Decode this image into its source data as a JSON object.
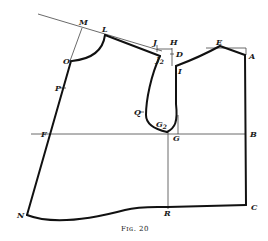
{
  "figure": {
    "caption": "Fig. 20",
    "caption_display": "Fɪɢ. 20"
  },
  "points": {
    "M": "M",
    "L": "L",
    "O": "O",
    "P": "P",
    "F": "F",
    "N": "N",
    "J": "J",
    "J2_main": "J",
    "J2_sub": "2",
    "H": "H",
    "D": "D",
    "I": "I",
    "E": "E",
    "A": "A",
    "Q": "Q",
    "G2_main": "G",
    "G2_sub": "2",
    "G": "G",
    "B": "B",
    "R": "R",
    "C": "C"
  },
  "colors": {
    "line": "#111111",
    "construction_line": "#444444",
    "background": "#ffffff"
  }
}
